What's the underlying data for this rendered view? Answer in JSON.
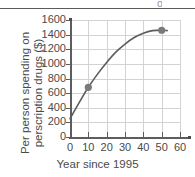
{
  "chart_data": {
    "type": "line",
    "title": "",
    "xlabel": "Year since 1995",
    "ylabel": "Per person spending on perscription drugs ($)",
    "xlim": [
      0,
      60
    ],
    "ylim": [
      0,
      1600
    ],
    "xticks": [
      0,
      10,
      20,
      30,
      40,
      50,
      60
    ],
    "yticks": [
      0,
      200,
      400,
      600,
      800,
      1000,
      1200,
      1400,
      1600
    ],
    "grid": true,
    "legend": "none",
    "series": [
      {
        "name": "Per person spending on perscription drugs",
        "marked_points": [
          {
            "x": 10,
            "y": 680
          },
          {
            "x": 50,
            "y": 1460
          }
        ],
        "curve": [
          {
            "x": 0,
            "y": 250
          },
          {
            "x": 5,
            "y": 470
          },
          {
            "x": 10,
            "y": 680
          },
          {
            "x": 15,
            "y": 860
          },
          {
            "x": 20,
            "y": 1020
          },
          {
            "x": 25,
            "y": 1160
          },
          {
            "x": 30,
            "y": 1270
          },
          {
            "x": 35,
            "y": 1360
          },
          {
            "x": 40,
            "y": 1420
          },
          {
            "x": 45,
            "y": 1455
          },
          {
            "x": 50,
            "y": 1462
          },
          {
            "x": 53,
            "y": 1455
          }
        ]
      }
    ],
    "colors": {
      "curve": "#5d5d5d",
      "marker": "#7a7a7a",
      "grid": "#d3d3d3",
      "axis": "#5d5d5d",
      "text": "#4a4a4a",
      "background": "#ffffff"
    }
  },
  "top_rule": {
    "present": true
  },
  "ytick_labels": [
    "1600",
    "1400",
    "1200",
    "1000",
    "800",
    "600",
    "400",
    "200",
    "0"
  ],
  "xtick_labels": [
    "0",
    "10",
    "20",
    "30",
    "40",
    "50",
    "60"
  ]
}
